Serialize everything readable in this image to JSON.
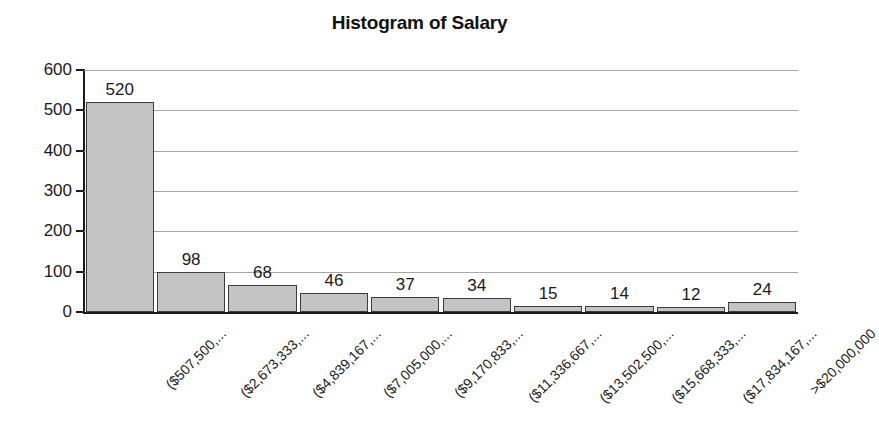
{
  "chart_data": {
    "type": "bar",
    "title": "Histogram of Salary",
    "xlabel": "",
    "ylabel": "",
    "ylim": [
      0,
      600
    ],
    "ytick_step": 100,
    "yticks": [
      0,
      100,
      200,
      300,
      400,
      500,
      600
    ],
    "grid": true,
    "legend": "none",
    "bar_fill_color": "#c3c3c3",
    "bar_border_color": "#3c3c3c",
    "gridline_color": "#a6a6a6",
    "axis_color": "#1a1a1a",
    "category_label_rotation_deg": -45,
    "categories": [
      "($507,500,...",
      "($2,673,333,...",
      "($4,839,167,...",
      "($7,005,000,...",
      "($9,170,833,...",
      "($11,336,667,...",
      "($13,502,500,...",
      "($15,668,333,...",
      "($17,834,167,...",
      ">$20,000,000"
    ],
    "values": [
      520,
      98,
      68,
      46,
      37,
      34,
      15,
      14,
      12,
      24
    ],
    "value_labels": [
      "520",
      "98",
      "68",
      "46",
      "37",
      "34",
      "15",
      "14",
      "12",
      "24"
    ]
  }
}
